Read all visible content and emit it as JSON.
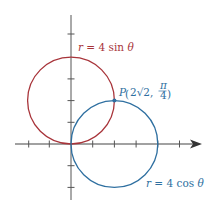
{
  "diagram": {
    "type": "polar-curves",
    "axes": {
      "origin_px": [
        71,
        144
      ],
      "unit_px": 21.7,
      "x_ticks": [
        -3,
        -2,
        -1,
        1,
        2,
        3,
        4,
        5
      ],
      "y_ticks": [
        -2,
        -1,
        1,
        2,
        3,
        4,
        5
      ],
      "color": "#444444"
    },
    "curves": [
      {
        "name": "r-equals-4-sin-theta",
        "label_r": "r",
        "label_eq": " = 4 sin ",
        "label_theta": "θ",
        "center": [
          0,
          2
        ],
        "radius": 2,
        "color": "#a8343a"
      },
      {
        "name": "r-equals-4-cos-theta",
        "label_r": "r",
        "label_eq": " = 4 cos ",
        "label_theta": "θ",
        "center": [
          2,
          0
        ],
        "radius": 2,
        "color": "#2e6fa0"
      }
    ],
    "point": {
      "label_name": "P",
      "label_coord_1": "2√2,",
      "label_num": "π",
      "label_den": "4",
      "position": [
        2,
        2
      ],
      "color": "#2e6fa0"
    }
  }
}
